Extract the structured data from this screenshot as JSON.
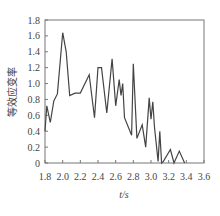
{
  "chart_data": {
    "type": "line",
    "title": "",
    "xlabel": "t/s",
    "ylabel": "等效应变率",
    "xlim": [
      1.8,
      3.6
    ],
    "ylim": [
      0,
      1.8
    ],
    "xticks": [
      1.8,
      2.0,
      2.2,
      2.4,
      2.6,
      2.8,
      3.0,
      3.2,
      3.4,
      3.6
    ],
    "yticks": [
      0,
      0.2,
      0.4,
      0.6,
      0.8,
      1.0,
      1.2,
      1.4,
      1.6,
      1.8
    ],
    "xtick_labels": [
      "1.8",
      "2.0",
      "2.2",
      "2.4",
      "2.6",
      "2.8",
      "3.0",
      "3.2",
      "3.4",
      "3.6"
    ],
    "ytick_labels": [
      "0",
      "0.2",
      "0.4",
      "0.6",
      "0.8",
      "1.0",
      "1.2",
      "1.4",
      "1.6",
      "1.8"
    ],
    "grid": false,
    "legend": null,
    "line_color": "#444444",
    "series": [
      {
        "name": "equivalent strain rate",
        "x": [
          1.8,
          1.82,
          1.86,
          1.9,
          1.94,
          2.0,
          2.04,
          2.08,
          2.14,
          2.2,
          2.3,
          2.36,
          2.4,
          2.44,
          2.5,
          2.56,
          2.6,
          2.64,
          2.66,
          2.68,
          2.7,
          2.78,
          2.8,
          2.84,
          2.9,
          2.94,
          2.98,
          3.0,
          3.02,
          3.04,
          3.08,
          3.1,
          3.12,
          3.14,
          3.22,
          3.26,
          3.32,
          3.38
        ],
        "y": [
          0.4,
          0.72,
          0.51,
          0.78,
          0.87,
          1.64,
          1.4,
          0.85,
          0.88,
          0.88,
          1.11,
          0.57,
          1.2,
          1.2,
          0.63,
          1.31,
          0.72,
          1.05,
          0.85,
          1.0,
          0.57,
          0.35,
          1.25,
          0.31,
          0.48,
          0.2,
          0.82,
          0.55,
          0.77,
          0.45,
          0.02,
          0.4,
          0.0,
          0.02,
          0.17,
          0.0,
          0.15,
          0.0
        ]
      }
    ]
  }
}
